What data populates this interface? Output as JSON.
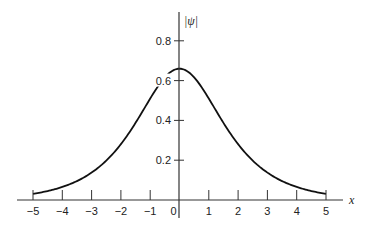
{
  "chart_data": {
    "type": "line",
    "title": "",
    "xlabel": "x",
    "ylabel": "|ψ|",
    "xlim": [
      -5,
      5
    ],
    "ylim": [
      0,
      0.8
    ],
    "grid": false,
    "legend": null,
    "x_ticks": [
      -5,
      -4,
      -3,
      -2,
      -1,
      0,
      1,
      2,
      3,
      4,
      5
    ],
    "x_tick_labels": [
      "−5",
      "−4",
      "−3",
      "−2",
      "−1",
      "0",
      "1",
      "2",
      "3",
      "4",
      "5"
    ],
    "y_ticks": [
      0.2,
      0.4,
      0.6,
      0.8
    ],
    "y_tick_labels": [
      "0.2",
      "0.4",
      "0.6",
      "0.8"
    ],
    "series": [
      {
        "name": "|ψ|",
        "description": "symmetric bell-shaped (sech-like) curve peaking at x=0",
        "x": [
          -5,
          -4,
          -3,
          -2,
          -1,
          0,
          1,
          2,
          3,
          4,
          5
        ],
        "values": [
          0.025,
          0.065,
          0.14,
          0.29,
          0.51,
          0.66,
          0.51,
          0.29,
          0.14,
          0.065,
          0.025
        ]
      }
    ]
  },
  "labels": {
    "x_axis": "x",
    "y_axis": "|ψ|",
    "origin": "0"
  }
}
